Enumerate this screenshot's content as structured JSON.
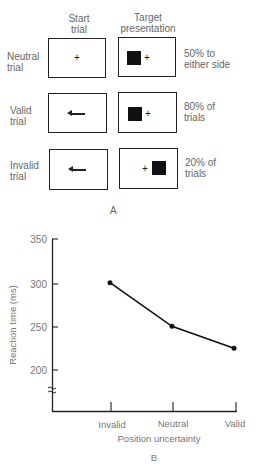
{
  "panel_a": {
    "headers": {
      "start_trial": "Start\ntrial",
      "start_line1": "Start",
      "start_line2": "trial",
      "target_line1": "Target",
      "target_line2": "presentation"
    },
    "rows": [
      {
        "label_line1": "Neutral",
        "label_line2": "trial",
        "cue": "+",
        "target": "+",
        "desc_line1": "50% to",
        "desc_line2": "either side"
      },
      {
        "label_line1": "Valid",
        "label_line2": "trial",
        "cue": "left-arrow",
        "target": "+",
        "desc_line1": "80% of",
        "desc_line2": "trials"
      },
      {
        "label_line1": "Invalid",
        "label_line2": "trial",
        "cue": "left-arrow",
        "target": "+",
        "desc_line1": "20% of",
        "desc_line2": "trials"
      }
    ],
    "caption": "A"
  },
  "panel_b": {
    "caption": "B"
  },
  "chart_data": {
    "type": "line",
    "title": "",
    "categories": [
      "Invalid",
      "Neutral",
      "Valid"
    ],
    "values": [
      300,
      250,
      225
    ],
    "xlabel": "Position uncertainty",
    "ylabel": "Reaction time (ms)",
    "yticks": [
      "350",
      "300",
      "250",
      "200"
    ],
    "ylim": [
      200,
      350
    ],
    "axis_break": true,
    "grid": false,
    "legend": null
  }
}
